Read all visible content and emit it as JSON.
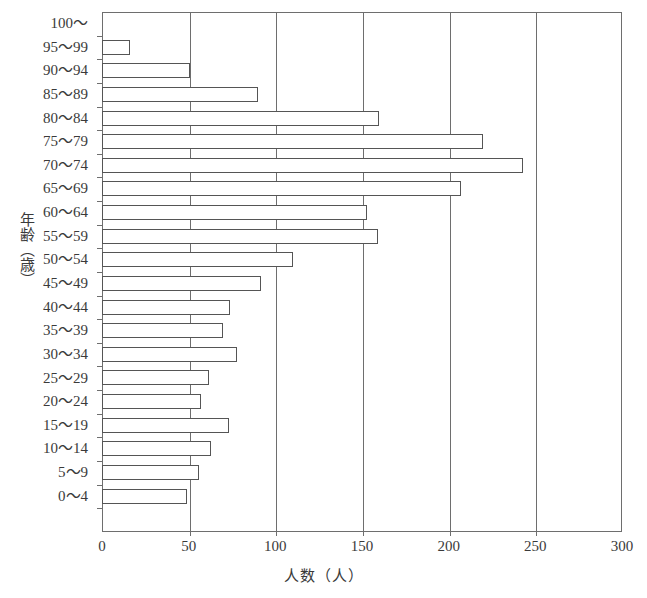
{
  "chart_data": {
    "type": "bar",
    "orientation": "horizontal",
    "title": "",
    "xlabel": "人数（人）",
    "ylabel": "年齢（歳）",
    "xlim": [
      0,
      300
    ],
    "xticks": [
      0,
      50,
      100,
      150,
      200,
      250,
      300
    ],
    "xtick_labels": [
      "0",
      "50",
      "100",
      "150",
      "200",
      "250",
      "300"
    ],
    "grid": true,
    "grid_axis": "x",
    "legend": false,
    "categories": [
      "100～",
      "95～99",
      "90～94",
      "85～89",
      "80～84",
      "75～79",
      "70～74",
      "65～69",
      "60～64",
      "55～59",
      "50～54",
      "45～49",
      "40～44",
      "35～39",
      "30～34",
      "25～29",
      "20～24",
      "15～19",
      "10～14",
      "5～9",
      "0～4"
    ],
    "values": [
      0,
      16,
      51,
      90,
      160,
      220,
      243,
      207,
      153,
      159,
      110,
      92,
      74,
      70,
      78,
      62,
      57,
      73,
      63,
      56,
      49
    ],
    "bar_face_color": "#ffffff",
    "bar_edge_color": "#555555",
    "axis_color": "#6e6e6e"
  }
}
